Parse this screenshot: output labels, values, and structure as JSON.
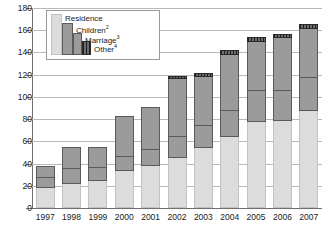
{
  "chart_data": {
    "type": "bar",
    "subtype": "stacked-column",
    "title": "",
    "xlabel": "",
    "ylabel": "",
    "ylim": [
      0,
      180
    ],
    "ytick_step": 20,
    "yticks": [
      0,
      20,
      40,
      60,
      80,
      100,
      120,
      140,
      160,
      180
    ],
    "grid": true,
    "legend_position": "top-left-inset",
    "categories": [
      "1997",
      "1998",
      "1999",
      "2000",
      "2001",
      "2002",
      "2003",
      "2004",
      "2005",
      "2006",
      "2007"
    ],
    "series": [
      {
        "name": "Residence",
        "values": [
          18,
          22,
          24,
          33,
          38,
          45,
          54,
          64,
          77,
          78,
          87
        ]
      },
      {
        "name": "Children",
        "values": [
          9,
          13,
          12,
          13,
          14,
          19,
          20,
          23,
          28,
          27,
          30
        ]
      },
      {
        "name": "Marriage",
        "values": [
          10,
          19,
          18,
          36,
          38,
          52,
          44,
          51,
          44,
          48,
          44
        ]
      },
      {
        "name": "Other",
        "values": [
          0,
          0,
          0,
          0,
          0,
          2,
          3,
          3,
          4,
          3,
          4
        ]
      }
    ],
    "totals": [
      37,
      54,
      54,
      82,
      90,
      118,
      121,
      141,
      153,
      156,
      165
    ],
    "legend": [
      {
        "label": "Residence",
        "sup": "",
        "color": "#dcdcdc"
      },
      {
        "label": "Children",
        "sup": "2",
        "color": "#9b9b9b"
      },
      {
        "label": "Marriage",
        "sup": "3",
        "color": "#9b9b9b"
      },
      {
        "label": "Other",
        "sup": "4",
        "color": "#4a4a4a"
      }
    ],
    "colors": {
      "residence": "#dcdcdc",
      "children": "#9b9b9b",
      "marriage": "#9b9b9b",
      "other": "#4a4a4a",
      "gridline": "#b9b9b9",
      "axis": "#6f6f6f",
      "text": "#1a1a1a"
    }
  }
}
